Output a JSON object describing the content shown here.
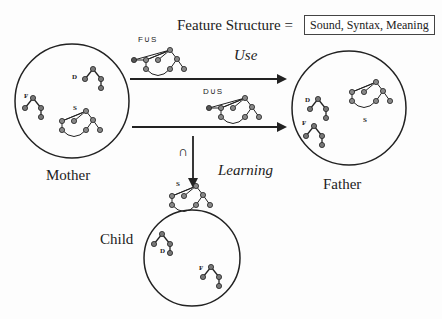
{
  "header": {
    "feature_structure_label": "Feature Structure =",
    "feature_structure_value": "Sound, Syntax, Meaning"
  },
  "nodes": {
    "mother": {
      "label": "Mother",
      "trees": [
        "D",
        "F",
        "S"
      ]
    },
    "father": {
      "label": "Father",
      "trees": [
        "D",
        "F",
        "S"
      ]
    },
    "child": {
      "label": "Child",
      "trees": [
        "D",
        "F"
      ]
    }
  },
  "edges": {
    "use_label": "Use",
    "learning_label": "Learning",
    "top_arrow_tree_label": "F∪S",
    "bottom_arrow_tree_label": "D∪S",
    "intersection_symbol": "∩",
    "learned_tree_label": "S"
  },
  "tree_labels": {
    "D": "D",
    "F": "F",
    "S": "S"
  },
  "colors": {
    "line": "#2a2a2a",
    "node_fill": "#888888",
    "background": "#fdfdfd"
  }
}
